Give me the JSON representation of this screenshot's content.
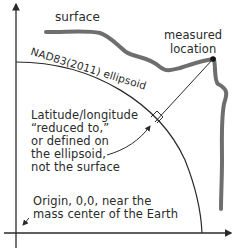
{
  "diagram": {
    "labels": {
      "surface": "surface",
      "measured_location": [
        "measured",
        "location"
      ],
      "ellipsoid": "NAD83(2011) ellipsoid",
      "latlon_note": [
        "Latitude/longitude",
        "“reduced to,”",
        "or defined on",
        "the ellipsoid,",
        "not the surface"
      ],
      "origin_note": [
        "Origin, 0,0, near the",
        "mass center of the Earth"
      ]
    },
    "colors": {
      "surface_line": "#6e6e6e",
      "ink": "#2a2a2a",
      "background": "#ffffff"
    }
  }
}
